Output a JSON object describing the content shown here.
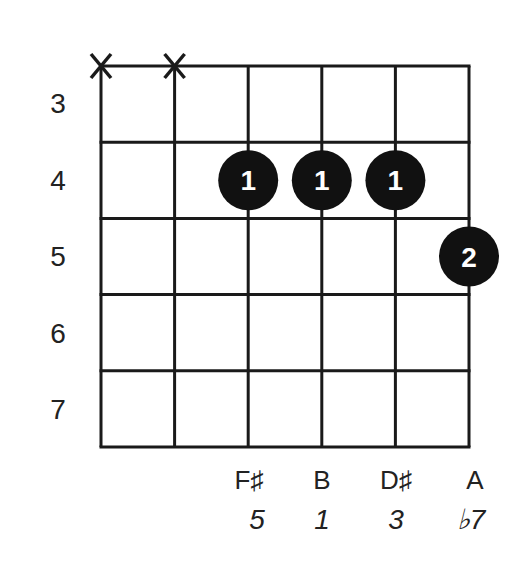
{
  "chord": {
    "strings": 6,
    "frets_shown": [
      3,
      4,
      5,
      6,
      7
    ],
    "muted_strings": [
      1,
      2
    ],
    "fingers": [
      {
        "string": 3,
        "fret": 4,
        "finger": "1"
      },
      {
        "string": 4,
        "fret": 4,
        "finger": "1"
      },
      {
        "string": 5,
        "fret": 4,
        "finger": "1"
      },
      {
        "string": 6,
        "fret": 5,
        "finger": "2"
      }
    ],
    "muted_symbol": "X"
  },
  "fret_labels": [
    "3",
    "4",
    "5",
    "6",
    "7"
  ],
  "notes": [
    {
      "string": 3,
      "name": "F♯",
      "interval": "5"
    },
    {
      "string": 4,
      "name": "B",
      "interval": "1"
    },
    {
      "string": 5,
      "name": "D♯",
      "interval": "3"
    },
    {
      "string": 6,
      "name": "A",
      "interval": "♭7"
    }
  ],
  "colors": {
    "line": "#1a1a1a",
    "dot": "#111111",
    "dot_text": "#ffffff"
  }
}
